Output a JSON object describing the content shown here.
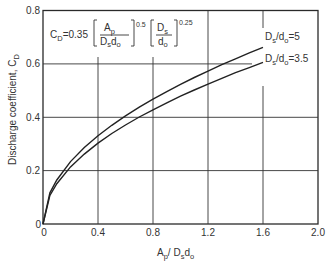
{
  "chart_data": {
    "type": "line",
    "title": "",
    "xlabel": "A_p / D_s d_o",
    "ylabel": "Discharge coefficient, C_D",
    "xlim": [
      0,
      2.0
    ],
    "ylim": [
      0,
      0.8
    ],
    "xticks": [
      "0",
      "0.4",
      "0.8",
      "1.2",
      "1.6",
      "2.0"
    ],
    "yticks": [
      "0",
      "0.2",
      "0.4",
      "0.6",
      "0.8"
    ],
    "grid": true,
    "legend_position": "inline labels at right end of curves",
    "annotation": "C_D = 0.35 [A_p / D_s d_o]^0.5 [D_s / d_o]^0.25",
    "series": [
      {
        "name": "D_s/d_o = 5",
        "x": [
          0,
          0.05,
          0.1,
          0.2,
          0.3,
          0.4,
          0.5,
          0.6,
          0.7,
          0.8,
          0.9,
          1.0,
          1.1,
          1.2,
          1.3,
          1.4,
          1.5,
          1.6
        ],
        "values": [
          0,
          0.117,
          0.165,
          0.234,
          0.287,
          0.331,
          0.37,
          0.405,
          0.438,
          0.468,
          0.496,
          0.523,
          0.549,
          0.573,
          0.597,
          0.619,
          0.641,
          0.662
        ]
      },
      {
        "name": "D_s/d_o = 3.5",
        "x": [
          0,
          0.05,
          0.1,
          0.2,
          0.3,
          0.4,
          0.5,
          0.6,
          0.7,
          0.8,
          0.9,
          1.0,
          1.1,
          1.2,
          1.3,
          1.4,
          1.5,
          1.6
        ],
        "values": [
          0,
          0.107,
          0.151,
          0.214,
          0.262,
          0.303,
          0.339,
          0.371,
          0.401,
          0.428,
          0.454,
          0.479,
          0.502,
          0.524,
          0.546,
          0.567,
          0.586,
          0.606
        ]
      }
    ]
  },
  "labels": {
    "y_axis": "Discharge coefficient, C",
    "y_axis_sub": "D",
    "x_axis_main_A": "A",
    "x_axis_sub_p": "p",
    "x_axis_mid": "/ D",
    "x_axis_sub_s": "s",
    "x_axis_d": "d",
    "x_axis_sub_o": "o",
    "formula_lhs": "C",
    "formula_lhs_sub": "D",
    "formula_eq": "=0.35",
    "formula_frac1_num": "A",
    "formula_frac1_num_sub": "p",
    "formula_frac1_den": "D",
    "formula_frac1_den_sub1": "s",
    "formula_frac1_den2": "d",
    "formula_frac1_den_sub2": "o",
    "formula_exp1": "0.5",
    "formula_frac2_num": "D",
    "formula_frac2_num_sub": "s",
    "formula_frac2_den": "d",
    "formula_frac2_den_sub": "o",
    "formula_exp2": "0.25",
    "curve1_D": "D",
    "curve1_s": "s",
    "curve1_slash": "/d",
    "curve1_o": "o",
    "curve1_val": "=5",
    "curve2_D": "D",
    "curve2_s": "s",
    "curve2_slash": "/d",
    "curve2_o": "o",
    "curve2_val": "=3.5"
  }
}
